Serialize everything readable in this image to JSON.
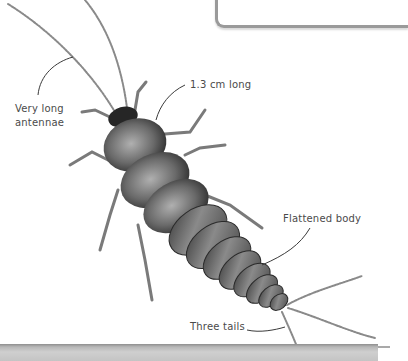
{
  "figure": {
    "labels": {
      "antennae": "Very long antennae",
      "antennae_line1": "Very long",
      "antennae_line2": "antennae",
      "length": "1.3 cm long",
      "body": "Flattened body",
      "tails": "Three tails"
    },
    "colors": {
      "background": "#ffffff",
      "label_text": "#4a4a4a",
      "leader_line": "#3a3a3a",
      "frame_border": "#9a9a9a",
      "bottom_strip": "#c4c4c4",
      "insect_dark": "#2a2a2a",
      "insect_mid": "#6e6e6e",
      "insect_light": "#b5b5b5"
    }
  }
}
